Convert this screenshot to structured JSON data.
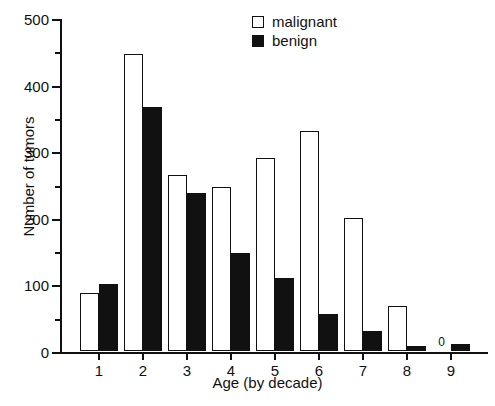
{
  "chart_data": {
    "type": "bar",
    "title": "",
    "xlabel": "Age (by decade)",
    "ylabel": "Number of tumors",
    "categories": [
      "1",
      "2",
      "3",
      "4",
      "5",
      "6",
      "7",
      "8",
      "9"
    ],
    "series": [
      {
        "name": "malignant",
        "color": "#ffffff",
        "values": [
          87,
          446,
          265,
          247,
          290,
          331,
          200,
          68,
          0
        ]
      },
      {
        "name": "benign",
        "color": "#111111",
        "values": [
          100,
          366,
          237,
          147,
          110,
          55,
          30,
          8,
          10
        ]
      }
    ],
    "annotations": [
      {
        "text": "0",
        "series": "malignant",
        "category": "9"
      }
    ],
    "ylim": [
      0,
      500
    ],
    "y_major_ticks": [
      0,
      100,
      200,
      300,
      400,
      500
    ],
    "y_minor_ticks": [
      50,
      150,
      250,
      350,
      450
    ],
    "y_tick_labels": [
      "0",
      "100",
      "200",
      "300",
      "400",
      "500"
    ],
    "x_tick_labels": [
      "1",
      "2",
      "3",
      "4",
      "5",
      "6",
      "7",
      "8",
      "9"
    ],
    "grid": false,
    "legend_position": "top-center"
  },
  "legend": {
    "entries": [
      {
        "label": "malignant",
        "style": "open"
      },
      {
        "label": "benign",
        "style": "filled"
      }
    ]
  },
  "axes": {
    "y_title": "Number of tumors",
    "x_title": "Age (by decade)"
  }
}
